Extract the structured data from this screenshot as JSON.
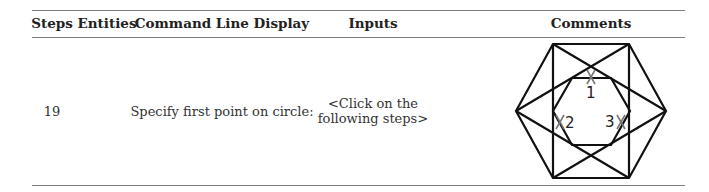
{
  "table": {
    "headers": {
      "steps": "Steps",
      "entities": "Entities",
      "command": "Command Line Display",
      "inputs": "Inputs",
      "comments": "Comments"
    },
    "rows": [
      {
        "step": "19",
        "entities": "",
        "command": "Specify first point on circle:",
        "inputs_line1": "<Click on the",
        "inputs_line2": "following steps>",
        "comments": {
          "diagram": "hexagon-rectangle-construction",
          "markers": [
            {
              "label": "1",
              "mark": "X"
            },
            {
              "label": "2",
              "mark": "X"
            },
            {
              "label": "3",
              "mark": "X"
            }
          ]
        }
      }
    ]
  },
  "colors": {
    "rule": "#7a7a7a",
    "lines": "#111111",
    "marker": "#777777",
    "text": "#222222"
  }
}
